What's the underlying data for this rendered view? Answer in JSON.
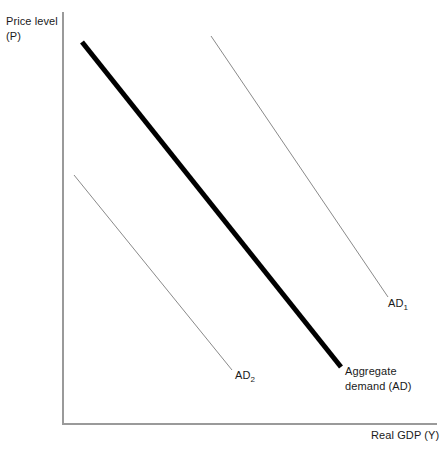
{
  "chart_data": {
    "type": "line",
    "title": "",
    "subtitle": "",
    "xlabel": "Real GDP (Y)",
    "ylabel": "Price level\n(P)",
    "grid": false,
    "legend": "none",
    "axis_ticks": {
      "x": [],
      "y": []
    },
    "xlim": [
      0,
      100
    ],
    "ylim": [
      0,
      100
    ],
    "annotations": [
      {
        "name": "ad-label",
        "text": "Aggregate\ndemand (AD)",
        "x": 75.4,
        "y": 14.6
      },
      {
        "name": "ad1-label",
        "text": "AD",
        "subscript": "1",
        "x": 87.0,
        "y": 31.2
      },
      {
        "name": "ad2-label",
        "text": "AD",
        "subscript": "2",
        "x": 46.0,
        "y": 13.8
      }
    ],
    "series": [
      {
        "name": "Aggregate demand (AD)",
        "label": "Aggregate demand (AD)",
        "style": "thick",
        "color": "#000000",
        "width": 5,
        "x": [
          5.1,
          74.3
        ],
        "y": [
          92.7,
          13.8
        ],
        "points_px": [
          [
            82,
            42
          ],
          [
            341,
            367
          ]
        ]
      },
      {
        "name": "AD1",
        "label": "AD",
        "subscript": "1",
        "style": "thin",
        "color": "#8a8a8a",
        "width": 1,
        "x": [
          39.6,
          86.9
        ],
        "y": [
          94.2,
          30.8
        ],
        "points_px": [
          [
            211,
            36
          ],
          [
            388,
            297
          ]
        ]
      },
      {
        "name": "AD2",
        "label": "AD",
        "subscript": "2",
        "style": "thin",
        "color": "#8a8a8a",
        "width": 1,
        "x": [
          2.9,
          45.2
        ],
        "y": [
          60.4,
          13.1
        ],
        "points_px": [
          [
            74,
            175
          ],
          [
            232,
            370
          ]
        ]
      }
    ]
  },
  "axes": {
    "y_label": "Price level\n(P)",
    "x_label": "Real GDP (Y)",
    "color": "#9a9a9a",
    "width": 2,
    "origin_px": [
      63,
      424
    ],
    "y_top_px": 12,
    "x_right_px": 437
  },
  "labels": {
    "ad_line1": "Aggregate",
    "ad_line2": "demand (AD)",
    "ad1_base": "AD",
    "ad1_sub": "1",
    "ad2_base": "AD",
    "ad2_sub": "2"
  },
  "colors": {
    "background": "#ffffff",
    "axis": "#9a9a9a",
    "primary_curve": "#000000",
    "shifted_curve": "#8a8a8a",
    "text": "#1a1a1a"
  }
}
